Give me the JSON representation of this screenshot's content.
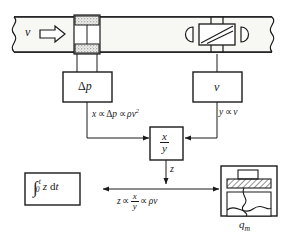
{
  "diagram": {
    "colors": {
      "line": "#1a1a1a",
      "background": "#ffffff",
      "pipe_fill": "#f7f7f4",
      "plate_fill": "#e8e8e4",
      "hatch": "#3a3a3a"
    },
    "pipe": {
      "flow_label": "v",
      "arrow_name": "flow-direction-arrow",
      "orifice_name": "orifice-plate",
      "sensor_name": "velocity-sensor"
    },
    "blocks": {
      "delta_p": {
        "label_delta": "Δ",
        "label_p": "p",
        "name": "delta-p-block"
      },
      "velocity": {
        "label": "v",
        "name": "velocity-block"
      },
      "divider": {
        "numerator": "x",
        "denominator": "y",
        "name": "divider-block"
      },
      "integrator": {
        "integral_sign": "∫",
        "lower_limit": "0",
        "upper_limit": "t",
        "integrand": "z",
        "differential_d": "d",
        "differential_t": "t",
        "name": "integrator-block"
      },
      "display": {
        "label_q": "q",
        "label_sub": "m",
        "name": "totalizer-display"
      }
    },
    "signals": {
      "x_relation": {
        "lhs": "x",
        "prop1": "∝",
        "mid_delta": "Δ",
        "mid_p": "p",
        "prop2": "∝",
        "rho": "ρ",
        "v": "v",
        "exponent": "2"
      },
      "y_relation": {
        "lhs": "y",
        "prop": "∝",
        "rhs": "v"
      },
      "z_label": "z",
      "z_relation": {
        "lhs": "z",
        "prop1": "∝",
        "num": "x",
        "den": "y",
        "prop2": "∝",
        "rho": "ρ",
        "v": "v"
      }
    }
  }
}
